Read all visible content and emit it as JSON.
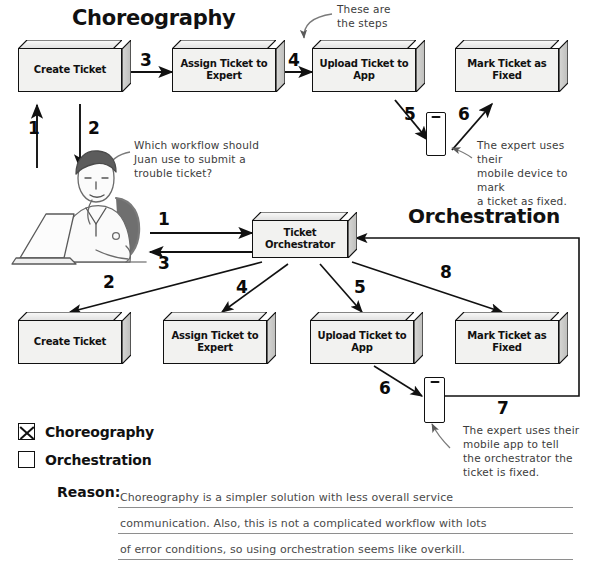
{
  "page": {
    "title_choreography": "Choreography",
    "title_orchestration": "Orchestration"
  },
  "choreography": {
    "boxes": [
      {
        "id": "create-ticket",
        "label": "Create\nTicket"
      },
      {
        "id": "assign-ticket-to-expert",
        "label": "Assign Ticket to\nExpert"
      },
      {
        "id": "upload-ticket-to-app",
        "label": "Upload Ticket to\nApp"
      },
      {
        "id": "mark-ticket-as-fixed",
        "label": "Mark Ticket as\nFixed"
      }
    ],
    "steps": [
      "1",
      "2",
      "3",
      "4",
      "5",
      "6"
    ],
    "annotations": {
      "steps_note": "These are\nthe steps",
      "question": "Which workflow should\nJuan use to submit a\ntrouble ticket?",
      "mobile_note": "The expert uses their\nmobile device to mark\na ticket as fixed."
    }
  },
  "orchestration": {
    "orchestrator": {
      "id": "ticket-orchestrator",
      "label": "Ticket\nOrchestrator"
    },
    "boxes": [
      {
        "id": "create-ticket",
        "label": "Create\nTicket"
      },
      {
        "id": "assign-ticket-to-expert",
        "label": "Assign Ticket to\nExpert"
      },
      {
        "id": "upload-ticket-to-app",
        "label": "Upload Ticket to\nApp"
      },
      {
        "id": "mark-ticket-as-fixed",
        "label": "Mark Ticket as\nFixed"
      }
    ],
    "steps": [
      "1",
      "2",
      "3",
      "4",
      "5",
      "6",
      "7",
      "8"
    ],
    "annotations": {
      "mobile_note": "The expert uses their\nmobile app to tell\nthe orchestrator the\nticket is fixed."
    }
  },
  "answer": {
    "options": [
      {
        "label": "Choreography",
        "checked": true
      },
      {
        "label": "Orchestration",
        "checked": false
      }
    ],
    "reason_label": "Reason:",
    "reason_lines": [
      "Choreography is a simpler solution with less overall service",
      "communication. Also, this is not a complicated workflow with lots",
      "of error conditions, so using orchestration seems like overkill."
    ]
  },
  "colors": {
    "ink": "#111111",
    "box_face": "#f2f2f0",
    "handwriting": "#3c3c3c",
    "rule": "#8e8e8e"
  }
}
